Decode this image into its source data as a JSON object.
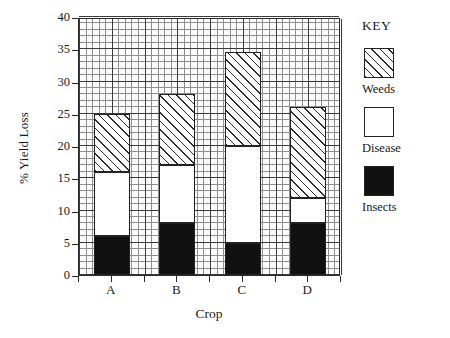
{
  "chart_data": {
    "type": "bar",
    "subtype": "stacked-bar",
    "title": "",
    "xlabel": "Crop",
    "ylabel": "% Yield Loss",
    "categories": [
      "A",
      "B",
      "C",
      "D"
    ],
    "series": [
      {
        "name": "Insects",
        "values": [
          6,
          8,
          5,
          8
        ],
        "fill": "solid-black",
        "color": "#111111"
      },
      {
        "name": "Disease",
        "values": [
          10,
          9,
          15,
          4
        ],
        "fill": "white",
        "color": "#ffffff"
      },
      {
        "name": "Weeds",
        "values": [
          9,
          11,
          14.5,
          14
        ],
        "fill": "diagonal-hatch",
        "color": "#2c2c2c"
      }
    ],
    "stack_totals": [
      25,
      28,
      34.5,
      26
    ],
    "segment_boundaries": {
      "A": {
        "insects_top": 6,
        "disease_top": 16,
        "weeds_top": 25
      },
      "B": {
        "insects_top": 8,
        "disease_top": 17,
        "weeds_top": 28
      },
      "C": {
        "insects_top": 5,
        "disease_top": 20,
        "weeds_top": 34.5
      },
      "D": {
        "insects_top": 8,
        "disease_top": 12,
        "weeds_top": 26
      }
    },
    "ylim": [
      0,
      40
    ],
    "ytick_values": [
      0,
      5,
      10,
      15,
      20,
      25,
      30,
      35,
      40
    ],
    "ytick_labels": [
      "0",
      "5",
      "10",
      "15",
      "20",
      "25",
      "30",
      "35",
      "40"
    ],
    "grid": {
      "minor": true,
      "minor_step": 1,
      "major_step": 5,
      "vertical": true,
      "horizontal": true
    },
    "legend": {
      "position": "right",
      "title": "KEY",
      "entries": [
        "Weeds",
        "Disease",
        "Insects"
      ]
    }
  },
  "legend": {
    "title": "KEY",
    "entries": [
      {
        "label": "Weeds",
        "swatch": "hatch-swatch"
      },
      {
        "label": "Disease",
        "swatch": "white-swatch"
      },
      {
        "label": "Insects",
        "swatch": "black-swatch"
      }
    ]
  },
  "axes": {
    "y_title": "% Yield Loss",
    "x_title": "Crop"
  }
}
